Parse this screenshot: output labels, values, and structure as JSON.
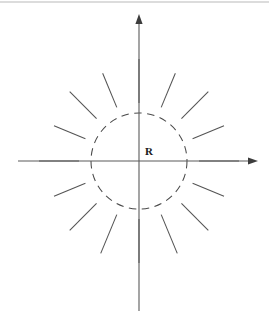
{
  "figure": {
    "background_color": "#ffffff",
    "width": 269,
    "height": 325,
    "top_rule": {
      "visible": true,
      "color": "#b9b9b9",
      "y": 2,
      "x1": 0,
      "x2": 269
    }
  },
  "labels": {
    "radius_label": "R",
    "radius_label_x": 145,
    "radius_label_y": 146,
    "radius_label_color": "#1a1a1a"
  },
  "axes": {
    "color": "#5a5a5a",
    "arrow_color": "#3c3c3c",
    "origin_x": 139,
    "origin_y": 161,
    "vertical": {
      "x": 139,
      "y_top": 20,
      "y_bottom": 311,
      "arrow": "up"
    },
    "horizontal": {
      "y": 161,
      "x_left": 18,
      "x_right": 252,
      "arrow": "right"
    }
  },
  "chart_data": {
    "type": "scatter",
    "xlabel": "",
    "ylabel": "",
    "grid": false,
    "legend": null,
    "center": {
      "x": 139,
      "y": 161
    },
    "circle": {
      "radius": 48,
      "style": "dashed",
      "dash_pattern": "7.5 5.5",
      "color": "#4a4a4a",
      "label": "R"
    },
    "rays": [
      {
        "name": "ray-0",
        "angle_deg": 0,
        "r_start": 60,
        "r_end": 100,
        "color": "#545454"
      },
      {
        "name": "ray-22",
        "angle_deg": 22.5,
        "r_start": 58,
        "r_end": 92,
        "color": "#545454"
      },
      {
        "name": "ray-45",
        "angle_deg": 45,
        "r_start": 60,
        "r_end": 98,
        "color": "#545454"
      },
      {
        "name": "ray-67",
        "angle_deg": 67.5,
        "r_start": 58,
        "r_end": 95,
        "color": "#545454"
      },
      {
        "name": "ray-90",
        "angle_deg": 90,
        "r_start": 58,
        "r_end": 102,
        "color": "#545454"
      },
      {
        "name": "ray-112",
        "angle_deg": 112.5,
        "r_start": 58,
        "r_end": 95,
        "color": "#545454"
      },
      {
        "name": "ray-135",
        "angle_deg": 135,
        "r_start": 60,
        "r_end": 98,
        "color": "#545454"
      },
      {
        "name": "ray-157",
        "angle_deg": 157.5,
        "r_start": 58,
        "r_end": 92,
        "color": "#545454"
      },
      {
        "name": "ray-180",
        "angle_deg": 180,
        "r_start": 60,
        "r_end": 100,
        "color": "#545454"
      },
      {
        "name": "ray-202",
        "angle_deg": 202.5,
        "r_start": 58,
        "r_end": 92,
        "color": "#545454"
      },
      {
        "name": "ray-225",
        "angle_deg": 225,
        "r_start": 60,
        "r_end": 98,
        "color": "#545454"
      },
      {
        "name": "ray-247",
        "angle_deg": 247.5,
        "r_start": 58,
        "r_end": 100,
        "color": "#545454"
      },
      {
        "name": "ray-270",
        "angle_deg": 270,
        "r_start": 58,
        "r_end": 102,
        "color": "#545454"
      },
      {
        "name": "ray-292",
        "angle_deg": 292.5,
        "r_start": 58,
        "r_end": 100,
        "color": "#545454"
      },
      {
        "name": "ray-315",
        "angle_deg": 315,
        "r_start": 60,
        "r_end": 98,
        "color": "#545454"
      },
      {
        "name": "ray-337",
        "angle_deg": 337.5,
        "r_start": 58,
        "r_end": 92,
        "color": "#545454"
      }
    ]
  }
}
